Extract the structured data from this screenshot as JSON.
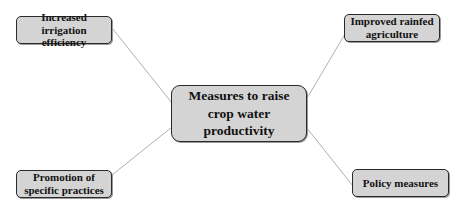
{
  "diagram": {
    "central": {
      "label": "Measures to raise crop water productivity"
    },
    "branches": [
      {
        "position": "top-left",
        "label": "Increased irrigation efficiency"
      },
      {
        "position": "top-right",
        "label": "Improved rainfed agriculture"
      },
      {
        "position": "bottom-left",
        "label": "Promotion of specific practices"
      },
      {
        "position": "bottom-right",
        "label": "Policy measures"
      }
    ],
    "colors": {
      "node_fill": "#d4d4d4",
      "node_border": "#2a2a2a",
      "connector": "#9a9a9a"
    }
  }
}
